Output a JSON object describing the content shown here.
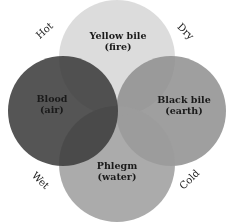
{
  "diagram": {
    "type": "venn-four-humours",
    "humours": [
      {
        "id": "yellow-bile",
        "name": "Yellow bile",
        "element": "(fire)",
        "color": "#d6d6d6"
      },
      {
        "id": "blood",
        "name": "Blood",
        "element": "(air)",
        "color": "#3c3c3c"
      },
      {
        "id": "black-bile",
        "name": "Black bile",
        "element": "(earth)",
        "color": "#8c8c8c"
      },
      {
        "id": "phlegm",
        "name": "Phlegm",
        "element": "(water)",
        "color": "#9a9a9a"
      }
    ],
    "qualities": {
      "top_left": "Hot",
      "top_right": "Dry",
      "bottom_left": "Wet",
      "bottom_right": "Cold"
    }
  }
}
